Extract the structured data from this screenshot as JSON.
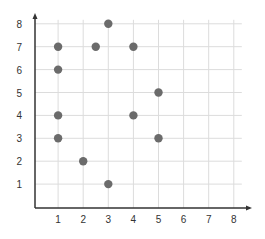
{
  "chart_data": {
    "type": "scatter",
    "title": "",
    "xlabel": "",
    "ylabel": "",
    "xlim": [
      0,
      8
    ],
    "ylim": [
      0,
      8
    ],
    "x_ticks": [
      "1",
      "2",
      "3",
      "4",
      "5",
      "6",
      "7",
      "8"
    ],
    "y_ticks": [
      "1",
      "2",
      "3",
      "4",
      "5",
      "6",
      "7",
      "8"
    ],
    "grid": true,
    "legend": "none",
    "series": [
      {
        "name": "points",
        "color": "#6b6b6b",
        "points": [
          {
            "x": 3,
            "y": 8
          },
          {
            "x": 1,
            "y": 7
          },
          {
            "x": 2.5,
            "y": 7
          },
          {
            "x": 4,
            "y": 7
          },
          {
            "x": 1,
            "y": 6
          },
          {
            "x": 5,
            "y": 5
          },
          {
            "x": 1,
            "y": 4
          },
          {
            "x": 4,
            "y": 4
          },
          {
            "x": 1,
            "y": 3
          },
          {
            "x": 5,
            "y": 3
          },
          {
            "x": 2,
            "y": 2
          },
          {
            "x": 3,
            "y": 1
          }
        ]
      }
    ]
  }
}
